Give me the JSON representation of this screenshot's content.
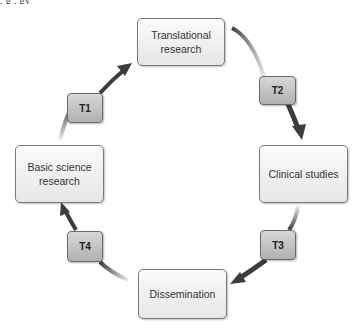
{
  "clipped_header_text": "           , g        ,                          gy",
  "diagram": {
    "stages": [
      {
        "id": "translational",
        "label": "Translational research"
      },
      {
        "id": "clinical",
        "label": "Clinical studies"
      },
      {
        "id": "dissemination",
        "label": "Dissemination"
      },
      {
        "id": "basic",
        "label": "Basic science research"
      }
    ],
    "transitions": [
      {
        "label": "T1",
        "from": "Basic science research",
        "to": "Translational research"
      },
      {
        "label": "T2",
        "from": "Translational research",
        "to": "Clinical studies"
      },
      {
        "label": "T3",
        "from": "Clinical studies",
        "to": "Dissemination"
      },
      {
        "label": "T4",
        "from": "Dissemination",
        "to": "Basic science research"
      }
    ],
    "colors": {
      "arrow": "#3d3d3d",
      "box_fill": "#efefef",
      "tag_fill": "#c2c2c2"
    }
  }
}
